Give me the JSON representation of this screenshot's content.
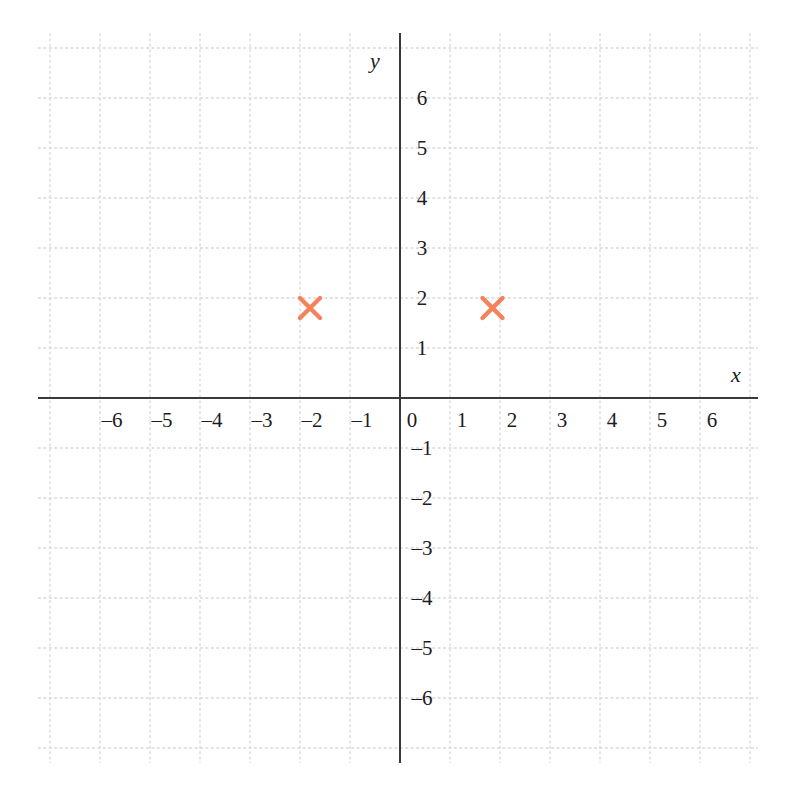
{
  "figure": {
    "type": "coordinate-plane",
    "width": 797,
    "height": 804,
    "background_color": "#ffffff"
  },
  "axes": {
    "x_axis_label": "x",
    "y_axis_label": "y",
    "axis_color": "#3a3a3a",
    "axis_line_width": 2,
    "origin_label": "0",
    "x_tick_labels": [
      "-6",
      "-5",
      "-4",
      "-3",
      "-2",
      "-1",
      "1",
      "2",
      "3",
      "4",
      "5",
      "6"
    ],
    "x_tick_values": [
      -6,
      -5,
      -4,
      -3,
      -2,
      -1,
      1,
      2,
      3,
      4,
      5,
      6
    ],
    "y_tick_labels": [
      "6",
      "5",
      "4",
      "3",
      "2",
      "1",
      "-1",
      "-2",
      "-3",
      "-4",
      "-5",
      "-6"
    ],
    "y_tick_values": [
      6,
      5,
      4,
      3,
      2,
      1,
      -1,
      -2,
      -3,
      -4,
      -5,
      -6
    ]
  },
  "grid": {
    "visible": true,
    "color": "#d9d9de",
    "style": "dashed",
    "spacing_units": 1,
    "x_min": -7.24,
    "x_max": 7.16,
    "y_min": -7.3,
    "y_max": 7.3
  },
  "chart_data": {
    "type": "scatter",
    "title": "",
    "xlabel": "x",
    "ylabel": "y",
    "xlim": [
      -7.24,
      7.16
    ],
    "ylim": [
      -7.3,
      7.3
    ],
    "grid": true,
    "legend": "none",
    "marker_style": "x-cross",
    "marker_color": "#f4825a",
    "marker_size": 20,
    "series": [
      {
        "name": "plotted-points",
        "points": [
          {
            "x": -1.8,
            "y": 1.8
          },
          {
            "x": 1.85,
            "y": 1.8
          }
        ]
      }
    ],
    "xticks": [
      -6,
      -5,
      -4,
      -3,
      -2,
      -1,
      0,
      1,
      2,
      3,
      4,
      5,
      6
    ],
    "yticks": [
      -6,
      -5,
      -4,
      -3,
      -2,
      -1,
      0,
      1,
      2,
      3,
      4,
      5,
      6
    ]
  }
}
